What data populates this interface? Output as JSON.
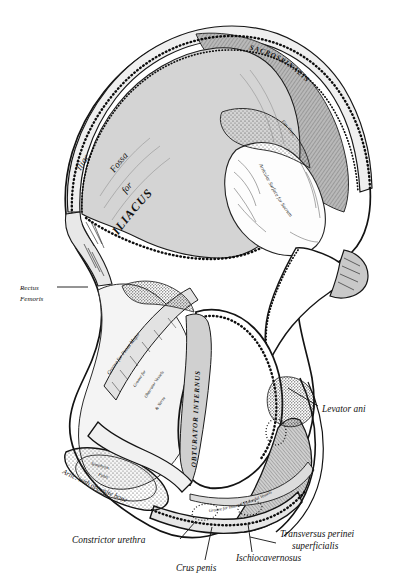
{
  "figure": {
    "style": "engraving",
    "background_color": "#ffffff",
    "ink_color": "#111111",
    "fossa_fill": "#d4d4d4"
  },
  "labels": {
    "iliac_fossa_line1": "Iliac",
    "iliac_fossa_line2": "Fossa",
    "iliac_fossa_line3": "for",
    "iliac_fossa_line4": "ILIACUS",
    "sacrospinalis": "SACROSPINALIS",
    "articular_surface": "Articular Surface for Sacrum",
    "posterior_line": "Iliac Crest",
    "rectus_femoris": "Rectus",
    "rectus_femoris2": "Femoris",
    "groove_psoas": "Groove for Psoas Major",
    "groove_obturator_1": "Groove for",
    "groove_obturator_2": "Obturator Vessels",
    "groove_obturator_3": "& Nerve",
    "obturator_internus": "OBTURATOR INTERNUS",
    "symphysis_1": "Symphysis",
    "symphysis_2": "Pubis",
    "artic_opposite": "Artic. with opposite bone",
    "levator_ani": "Levator ani",
    "groove_pudendal": "Groove for Internal Pudendal Vessels",
    "constrictor_urethra": "Constrictor urethra",
    "crus_penis": "Crus penis",
    "ischiocavernosus": "Ischiocavernosus",
    "transversus_1": "Transversus perinei",
    "transversus_2": "superficialis"
  }
}
